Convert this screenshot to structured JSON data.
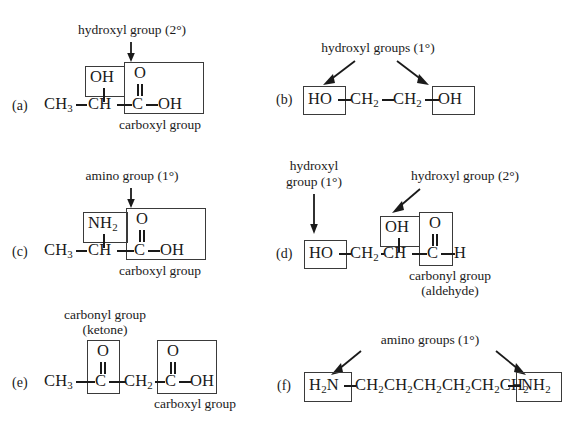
{
  "figure": {
    "background_color": "#ffffff",
    "ink_color": "#1a1a1a",
    "box_color": "#3a3a3a"
  },
  "structures": [
    {
      "index": "(a)",
      "formula_text": "CH3-CH-C-OH",
      "atoms": [
        "CH",
        "3",
        "CH",
        "C",
        "OH"
      ],
      "top_group": "OH",
      "carbonyl_oxygen": "O",
      "double_bond": "||",
      "callouts": [
        {
          "text": "hydroxyl group (2°)",
          "arrow": "down-short",
          "points_to": "OH"
        }
      ],
      "captions": [
        "carboxyl group"
      ]
    },
    {
      "index": "(b)",
      "formula_text": "HO-CH2-CH2-OH",
      "atoms": [
        "HO",
        "CH",
        "2",
        "CH",
        "2",
        "OH"
      ],
      "callouts": [
        {
          "text": "hydroxyl groups (1°)",
          "arrow": "diagonal-left",
          "points_to": "HO"
        },
        {
          "text": "",
          "arrow": "diagonal-right",
          "points_to": "OH"
        }
      ],
      "captions": []
    },
    {
      "index": "(c)",
      "formula_text": "CH3-CH-C-OH",
      "top_group": "NH2",
      "carbonyl_oxygen": "O",
      "double_bond": "||",
      "callouts": [
        {
          "text": "amino group (1°)",
          "arrow": "down-short",
          "points_to": "NH2"
        }
      ],
      "captions": [
        "carboxyl group"
      ]
    },
    {
      "index": "(d)",
      "formula_text": "HO-CH2-CH-C-H",
      "top_group": "OH",
      "carbonyl_oxygen": "O",
      "double_bond": "||",
      "callouts": [
        {
          "text": "hydroxyl",
          "text2": "group (1°)",
          "arrow": "down-long",
          "points_to": "HO"
        },
        {
          "text": "hydroxyl group (2°)",
          "arrow": "diagonal-left",
          "points_to": "OH"
        }
      ],
      "captions": [
        "carbonyl group",
        "(aldehyde)"
      ]
    },
    {
      "index": "(e)",
      "formula_text": "CH3-C-CH2-C-OH",
      "carbonyl_oxygen_1": "O",
      "carbonyl_oxygen_2": "O",
      "double_bond": "||",
      "callouts": [
        {
          "text": "carbonyl group",
          "text2": "(ketone)",
          "arrow": "none",
          "points_to": "C=O"
        }
      ],
      "captions": [
        "carboxyl group"
      ]
    },
    {
      "index": "(f)",
      "formula_text": "H2N-CH2CH2CH2CH2CH2CH2-NH2",
      "chain_repeat_count": 6,
      "end_group_left": "H2N",
      "end_group_right": "NH2",
      "callouts": [
        {
          "text": "amino groups (1°)",
          "arrow": "diagonal-left",
          "points_to": "H2N"
        },
        {
          "text": "",
          "arrow": "diagonal-right",
          "points_to": "NH2"
        }
      ],
      "captions": []
    }
  ],
  "labels": {
    "a_index": "(a)",
    "b_index": "(b)",
    "c_index": "(c)",
    "d_index": "(d)",
    "e_index": "(e)",
    "f_index": "(f)",
    "a_callout": "hydroxyl group (2°)",
    "a_caption": "carboxyl group",
    "a_ch3": "CH",
    "a_ch3_sub": "3",
    "a_ch": "CH",
    "a_c": "C",
    "a_oh_right": "OH",
    "a_oh_top": "OH",
    "a_o": "O",
    "a_dbl": "||",
    "b_callout": "hydroxyl groups (1°)",
    "b_ho": "HO",
    "b_ch2_1": "CH",
    "b_ch2_1_sub": "2",
    "b_ch2_2": "CH",
    "b_ch2_2_sub": "2",
    "b_oh": "OH",
    "c_callout": "amino group (1°)",
    "c_caption": "carboxyl group",
    "c_ch3": "CH",
    "c_ch3_sub": "3",
    "c_ch": "CH",
    "c_c": "C",
    "c_oh_right": "OH",
    "c_nh2": "NH",
    "c_nh2_sub": "2",
    "c_o": "O",
    "c_dbl": "||",
    "d_callout_l1": "hydroxyl",
    "d_callout_l2": "group (1°)",
    "d_callout_r": "hydroxyl group (2°)",
    "d_caption_1": "carbonyl group",
    "d_caption_2": "(aldehyde)",
    "d_ho": "HO",
    "d_ch2": "CH",
    "d_ch2_sub": "2",
    "d_ch": "CH",
    "d_c": "C",
    "d_h": "H",
    "d_oh_top": "OH",
    "d_o": "O",
    "d_dbl": "||",
    "e_callout_1": "carbonyl group",
    "e_callout_2": "(ketone)",
    "e_caption": "carboxyl group",
    "e_ch3": "CH",
    "e_ch3_sub": "3",
    "e_c1": "C",
    "e_ch2": "CH",
    "e_ch2_sub": "2",
    "e_c2": "C",
    "e_oh": "OH",
    "e_o1": "O",
    "e_o2": "O",
    "e_dbl1": "||",
    "e_dbl2": "||",
    "f_callout": "amino groups (1°)",
    "f_h2n": "H",
    "f_h2n_sub": "2",
    "f_h2n_n": "N",
    "f_chain": "CH2CH2CH2CH2CH2CH2",
    "f_nh2": "NH",
    "f_nh2_sub": "2"
  }
}
